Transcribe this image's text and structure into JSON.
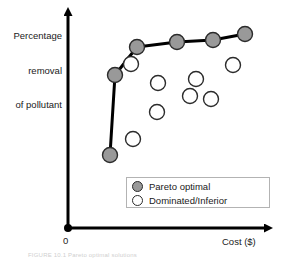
{
  "figure": {
    "background_color": "#ffffff",
    "caption": "FIGURE 10.1  Pareto optimal solutions"
  },
  "chart_data": {
    "type": "scatter",
    "title": "",
    "subtitle": "",
    "xlabel": "Cost ($)",
    "ylabel": "Percentage removal of pollutant",
    "ylabel_lines": [
      "Percentage",
      "removal",
      "of pollutant"
    ],
    "origin_label": "0",
    "grid": false,
    "xlim": [
      0,
      100
    ],
    "ylim": [
      0,
      100
    ],
    "axis_ticks": false,
    "axis_arrowheads": true,
    "legend_position": "inside-bottom-right",
    "colors": {
      "pareto_fill": "#999999",
      "pareto_stroke": "#2b2b2b",
      "dominated_fill": "#ffffff",
      "dominated_stroke": "#2b2b2b",
      "frontier_line": "#000000",
      "axis": "#000000",
      "text": "#1a1a1a",
      "legend_border": "#b3b3b3"
    },
    "series": [
      {
        "name": "Pareto optimal",
        "marker": "filled-circle",
        "fill": "#999999",
        "stroke": "#2b2b2b",
        "connected": true,
        "points": [
          {
            "cx": 110,
            "cy": 155,
            "r": 7.5
          },
          {
            "cx": 115,
            "cy": 75,
            "r": 7.5
          },
          {
            "cx": 137,
            "cy": 47,
            "r": 7.5
          },
          {
            "cx": 177,
            "cy": 42,
            "r": 7.5
          },
          {
            "cx": 213,
            "cy": 40,
            "r": 7.5
          },
          {
            "cx": 245,
            "cy": 34,
            "r": 7.5
          }
        ]
      },
      {
        "name": "Dominated/Inferior",
        "marker": "open-circle",
        "fill": "#ffffff",
        "stroke": "#2b2b2b",
        "connected": false,
        "points": [
          {
            "cx": 131,
            "cy": 64,
            "r": 7.5
          },
          {
            "cx": 133,
            "cy": 139,
            "r": 7.5
          },
          {
            "cx": 157,
            "cy": 112,
            "r": 7.5
          },
          {
            "cx": 158,
            "cy": 83,
            "r": 7.5
          },
          {
            "cx": 190,
            "cy": 96,
            "r": 7.5
          },
          {
            "cx": 196,
            "cy": 79,
            "r": 7.5
          },
          {
            "cx": 211,
            "cy": 99,
            "r": 7.5
          },
          {
            "cx": 233,
            "cy": 65,
            "r": 7.5
          }
        ]
      }
    ],
    "frontier_path": [
      {
        "x": 110,
        "y": 155
      },
      {
        "x": 115,
        "y": 75
      },
      {
        "x": 137,
        "y": 47
      },
      {
        "x": 177,
        "y": 42
      },
      {
        "x": 213,
        "y": 40
      },
      {
        "x": 245,
        "y": 34
      }
    ],
    "axes_geometry": {
      "origin": {
        "x": 68,
        "y": 228
      },
      "y_axis_top": {
        "x": 68,
        "y": 10
      },
      "x_axis_right": {
        "x": 272,
        "y": 228
      }
    },
    "legend": {
      "box": {
        "x": 126,
        "y": 177,
        "width": 144,
        "height": 31
      },
      "entries": [
        {
          "label": "Pareto optimal",
          "fill": "#999999",
          "stroke": "#2b2b2b"
        },
        {
          "label": "Dominated/Inferior",
          "fill": "#ffffff",
          "stroke": "#2b2b2b"
        }
      ]
    }
  }
}
